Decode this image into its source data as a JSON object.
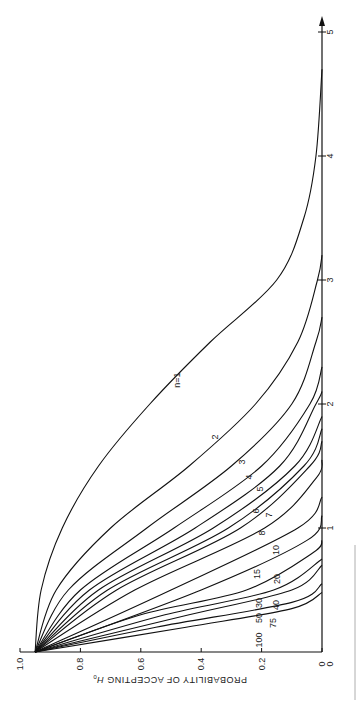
{
  "chart_data": {
    "type": "line",
    "title": "",
    "xlabel": "",
    "ylabel": "PROBABILITY OF ACCEPTING H0",
    "rotation": "chart rotated 90° (d axis runs bottom-to-top on right edge)",
    "x_ticks": [
      "0",
      "1",
      "2",
      "3",
      "4",
      "5"
    ],
    "y_ticks": [
      "0",
      "0.2",
      "0.4",
      "0.6",
      "0.8",
      "1.0"
    ],
    "xlim": [
      0,
      5
    ],
    "ylim": [
      0,
      1.0
    ],
    "grid": false,
    "legend": "inline curve labels",
    "series": [
      {
        "name": "n=1",
        "label": "n=1",
        "points": [
          [
            0,
            0.95
          ],
          [
            0.5,
            0.93
          ],
          [
            1,
            0.86
          ],
          [
            1.5,
            0.74
          ],
          [
            2,
            0.57
          ],
          [
            2.5,
            0.37
          ],
          [
            3,
            0.15
          ],
          [
            3.5,
            0.06
          ],
          [
            4,
            0.02
          ],
          [
            4.7,
            0
          ]
        ]
      },
      {
        "name": "2",
        "label": "2",
        "points": [
          [
            0,
            0.95
          ],
          [
            0.5,
            0.88
          ],
          [
            1,
            0.7
          ],
          [
            1.5,
            0.44
          ],
          [
            2,
            0.22
          ],
          [
            2.5,
            0.08
          ],
          [
            3,
            0.015
          ],
          [
            3.2,
            0
          ]
        ]
      },
      {
        "name": "3",
        "label": "3",
        "points": [
          [
            0,
            0.95
          ],
          [
            0.5,
            0.84
          ],
          [
            1,
            0.58
          ],
          [
            1.5,
            0.3
          ],
          [
            2,
            0.1
          ],
          [
            2.5,
            0.02
          ],
          [
            2.7,
            0
          ]
        ]
      },
      {
        "name": "4",
        "label": "4",
        "points": [
          [
            0,
            0.95
          ],
          [
            0.5,
            0.8
          ],
          [
            1,
            0.49
          ],
          [
            1.5,
            0.2
          ],
          [
            2,
            0.04
          ],
          [
            2.3,
            0
          ]
        ]
      },
      {
        "name": "5",
        "label": "5",
        "points": [
          [
            0,
            0.95
          ],
          [
            0.5,
            0.77
          ],
          [
            1,
            0.42
          ],
          [
            1.5,
            0.14
          ],
          [
            2,
            0.02
          ],
          [
            2.1,
            0
          ]
        ]
      },
      {
        "name": "6",
        "label": "6",
        "points": [
          [
            0,
            0.95
          ],
          [
            0.5,
            0.74
          ],
          [
            1,
            0.36
          ],
          [
            1.5,
            0.09
          ],
          [
            1.9,
            0
          ]
        ]
      },
      {
        "name": "7",
        "label": "7",
        "points": [
          [
            0,
            0.95
          ],
          [
            0.5,
            0.71
          ],
          [
            1,
            0.31
          ],
          [
            1.5,
            0.06
          ],
          [
            1.8,
            0
          ]
        ]
      },
      {
        "name": "8",
        "label": "8",
        "points": [
          [
            0,
            0.95
          ],
          [
            0.5,
            0.68
          ],
          [
            1,
            0.27
          ],
          [
            1.5,
            0.04
          ],
          [
            1.7,
            0
          ]
        ]
      },
      {
        "name": "10",
        "label": "10",
        "points": [
          [
            0,
            0.95
          ],
          [
            0.5,
            0.62
          ],
          [
            1,
            0.19
          ],
          [
            1.4,
            0.02
          ],
          [
            1.55,
            0
          ]
        ]
      },
      {
        "name": "15",
        "label": "15",
        "points": [
          [
            0,
            0.95
          ],
          [
            0.5,
            0.5
          ],
          [
            1,
            0.08
          ],
          [
            1.25,
            0
          ]
        ]
      },
      {
        "name": "20",
        "label": "20",
        "points": [
          [
            0,
            0.95
          ],
          [
            0.5,
            0.4
          ],
          [
            0.9,
            0.05
          ],
          [
            1.1,
            0
          ]
        ]
      },
      {
        "name": "30",
        "label": "30",
        "points": [
          [
            0,
            0.95
          ],
          [
            0.3,
            0.6
          ],
          [
            0.5,
            0.25
          ],
          [
            0.8,
            0.03
          ],
          [
            0.9,
            0
          ]
        ]
      },
      {
        "name": "40",
        "label": "40",
        "points": [
          [
            0,
            0.95
          ],
          [
            0.3,
            0.52
          ],
          [
            0.5,
            0.16
          ],
          [
            0.75,
            0
          ]
        ]
      },
      {
        "name": "50",
        "label": "50",
        "points": [
          [
            0,
            0.95
          ],
          [
            0.3,
            0.44
          ],
          [
            0.5,
            0.1
          ],
          [
            0.7,
            0
          ]
        ]
      },
      {
        "name": "75",
        "label": "75",
        "points": [
          [
            0,
            0.95
          ],
          [
            0.2,
            0.55
          ],
          [
            0.4,
            0.1
          ],
          [
            0.55,
            0
          ]
        ]
      },
      {
        "name": "100",
        "label": "100",
        "points": [
          [
            0,
            0.95
          ],
          [
            0.2,
            0.45
          ],
          [
            0.35,
            0.1
          ],
          [
            0.48,
            0
          ]
        ]
      }
    ]
  },
  "axis": {
    "y_title": "PROBABILITY OF ACCEPTING",
    "y_title_sym": "H",
    "y_title_sub": "0"
  }
}
